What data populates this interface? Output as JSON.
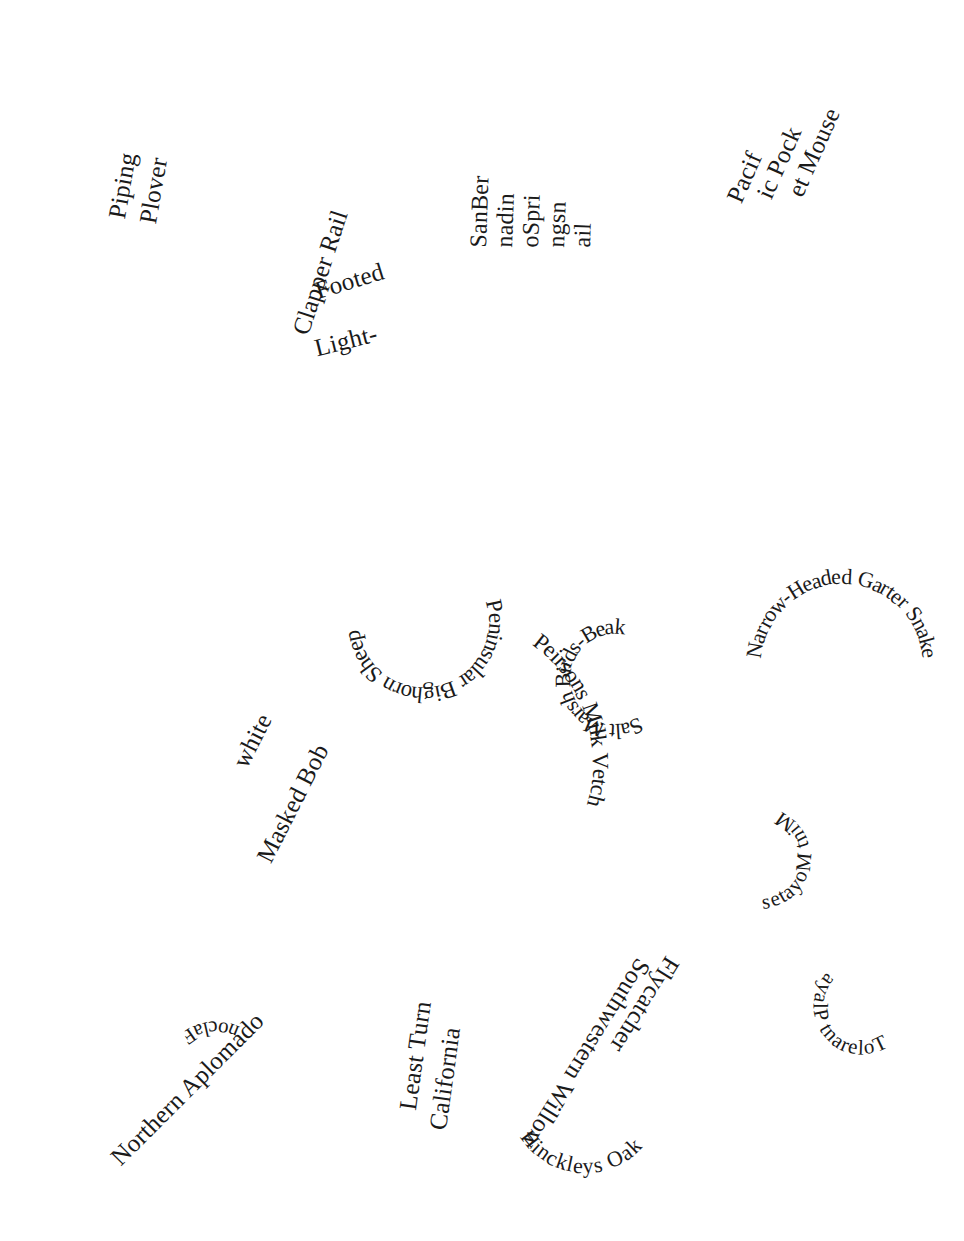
{
  "figure": {
    "type": "word-scatter",
    "title": "",
    "background_color": "#ffffff",
    "text_color": "#1a1a1a",
    "width": 964,
    "height": 1241
  },
  "labels": {
    "piping_plover_l1": "Piping",
    "piping_plover_l2": "Plover",
    "clapper_rail": "Clapper Rail",
    "footed": "Footed",
    "light": "Light-",
    "sanber": "SanBer",
    "nadin": "nadin",
    "ospri": "oSpri",
    "ngsn": "ngsn",
    "ail": "ail",
    "pacif": "Pacif",
    "ic_pock": "ic Pock",
    "et_mouse": "et Mouse",
    "fish_arc": "Yacqui Chub San Deigo Fairy Shrimp Sonora Chub Gila Topminnow Loach Minnow Spikedace",
    "bighorn_ring": "Peninsular Bighorn Sheep",
    "salt_marsh_ring": "Salt Marsh Birds-Beak",
    "garter_ring": "Narrow-Headed Garter Snake",
    "masked_bob": "Masked Bob",
    "white": "white",
    "peirsons_ring": "Peirsons Milk Vetch",
    "mint_ring": "Mint Moyates",
    "northern_aplomado": "Northern Aplomado",
    "falcon_ring": "Falcon",
    "least_turn": "Least Turn",
    "california": "California",
    "hinckleys_ring": "Hinckleys Oak",
    "southwestern_willow": "Southwestern Willow",
    "flycatcher": "Flycatcher",
    "playa_ring": "Tolerant Playa"
  },
  "species_list": [
    "Piping Plover",
    "Light-Footed Clapper Rail",
    "San Bernadino Springsnail",
    "Pacific Pocket Mouse",
    "Yacqui Chub",
    "San Deigo Fairy Shrimp",
    "Sonora Chub",
    "Gila Topminnow",
    "Loach Minnow",
    "Spikedace",
    "Peninsular Bighorn Sheep",
    "Salt Marsh Birds-Beak",
    "Narrow-Headed Garter Snake",
    "Masked Bobwhite",
    "Peirsons Milk Vetch",
    "Mint Moyates",
    "Northern Aplomado Falcon",
    "California Least Turn",
    "Hinckleys Oak",
    "Southwestern Willow Flycatcher",
    "Tolerant Playa"
  ]
}
